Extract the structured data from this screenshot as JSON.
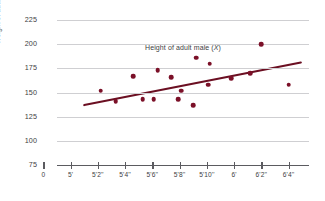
{
  "chart_data": {
    "type": "scatter",
    "title": "",
    "xlabel": "Height of adult male (X)",
    "ylabel": "Weight of adult male (Y)",
    "xlabel_text": "Height of adult male (",
    "xlabel_var": "X",
    "xlabel_tail": ")",
    "ylabel_text": "Weight of adult male (",
    "ylabel_var": "Y",
    "ylabel_tail": ")",
    "grid": true,
    "legend": "none",
    "yticks": [
      225,
      200,
      175,
      150,
      125,
      100,
      75
    ],
    "ylim": [
      75,
      225
    ],
    "xticks": [
      "0",
      "5'",
      "5'2''",
      "5'4''",
      "5'6''",
      "5'8''",
      "5'10''",
      "6'",
      "6'2''",
      "6'4''"
    ],
    "x_tick_inches": [
      0,
      60,
      62,
      64,
      66,
      68,
      70,
      72,
      74,
      76
    ],
    "xlim_inches": [
      59,
      77.5
    ],
    "point_color": "#7b1028",
    "line_color": "#6b0f22",
    "grid_color": "#cfcfd2",
    "axis_color": "#5b5b60",
    "points": [
      {
        "x_label": "5'2''",
        "x": 62.2,
        "y": 152
      },
      {
        "x_label": "5'3''",
        "x": 63.3,
        "y": 141
      },
      {
        "x_label": "5'4''",
        "x": 64.6,
        "y": 167
      },
      {
        "x_label": "5'5''",
        "x": 65.3,
        "y": 143
      },
      {
        "x_label": "5'6''",
        "x": 66.1,
        "y": 143
      },
      {
        "x_label": "5'6''",
        "x": 66.4,
        "y": 173
      },
      {
        "x_label": "5'7''",
        "x": 67.4,
        "y": 166
      },
      {
        "x_label": "5'8''",
        "x": 67.9,
        "y": 143
      },
      {
        "x_label": "5'8''",
        "x": 68.1,
        "y": 152
      },
      {
        "x_label": "5'9''",
        "x": 69.0,
        "y": 137
      },
      {
        "x_label": "5'9''",
        "x": 69.2,
        "y": 186
      },
      {
        "x_label": "5'10''",
        "x": 70.2,
        "y": 180
      },
      {
        "x_label": "5'10''",
        "x": 70.1,
        "y": 158
      },
      {
        "x_label": "6'",
        "x": 71.8,
        "y": 165
      },
      {
        "x_label": "6'1''",
        "x": 73.2,
        "y": 170
      },
      {
        "x_label": "6'2''",
        "x": 74.0,
        "y": 200
      },
      {
        "x_label": "6'4''",
        "x": 76.0,
        "y": 158
      }
    ],
    "trendline": {
      "x_start": 61.0,
      "y_start": 137,
      "x_end": 76.9,
      "y_end": 181
    }
  }
}
